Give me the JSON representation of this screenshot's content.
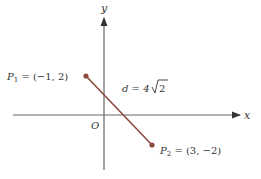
{
  "axes": {
    "x_label": "x",
    "y_label": "y",
    "origin_label": "O"
  },
  "points": [
    {
      "name": "P",
      "subscript": "1",
      "label_rest": " = (−1, 2)",
      "x": -1,
      "y": 2
    },
    {
      "name": "P",
      "subscript": "2",
      "label_rest": " = (3, −2)",
      "x": 3,
      "y": -2
    }
  ],
  "distance": {
    "prefix": "d = 4",
    "radicand": "2"
  },
  "colors": {
    "segment": "#8b4a3c",
    "axes": "#555555"
  }
}
